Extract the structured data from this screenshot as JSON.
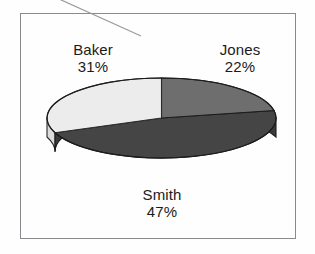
{
  "chart_data": {
    "type": "pie",
    "title": "",
    "subtitle": "",
    "xlabel": "",
    "ylabel": "",
    "three_d": true,
    "legend_position": "none",
    "labels_position": "outside",
    "grid": false,
    "categories": [
      "Jones",
      "Smith",
      "Baker"
    ],
    "values": [
      22,
      47,
      31
    ],
    "value_unit": "%",
    "slices": [
      {
        "name": "Jones",
        "value": 22,
        "label": "Jones",
        "value_label": "22%",
        "color": "#6e6e6e",
        "side_color": "#5a5a5a",
        "start_angle_deg": 0,
        "end_angle_deg": 79.2
      },
      {
        "name": "Smith",
        "value": 47,
        "label": "Smith",
        "value_label": "47%",
        "color": "#454545",
        "side_color": "#3a3a3a",
        "start_angle_deg": 79.2,
        "end_angle_deg": 248.4
      },
      {
        "name": "Baker",
        "value": 31,
        "label": "Baker",
        "value_label": "31%",
        "color": "#ececec",
        "side_color": "#dcdcdc",
        "start_angle_deg": 248.4,
        "end_angle_deg": 360
      }
    ],
    "total": 100
  },
  "figure": {
    "background_color": "#fefefe",
    "frame_color": "#8a8a8e",
    "label_color": "#1b1b1b",
    "leader_line_color": "#9a9a9e"
  },
  "labels": {
    "baker": {
      "name": "Baker",
      "percent": "31%"
    },
    "jones": {
      "name": "Jones",
      "percent": "22%"
    },
    "smith": {
      "name": "Smith",
      "percent": "47%"
    }
  }
}
